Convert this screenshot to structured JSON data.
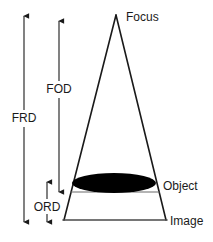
{
  "diagram": {
    "background_color": "#ffffff",
    "line_color": "#1a1a1a",
    "plane_line_color": "#555555",
    "object_fill_color": "#000000",
    "labels": {
      "focus": "Focus",
      "object": "Object",
      "image": "Image",
      "frd": "FRD",
      "fod": "FOD",
      "ord": "ORD"
    },
    "geometry": {
      "focus_point": {
        "x": 116,
        "y": 15
      },
      "cone_base_left": {
        "x": 64,
        "y": 220
      },
      "cone_base_right": {
        "x": 166,
        "y": 220
      },
      "object_plane_y": 192,
      "object_plane_left_x": 71,
      "object_plane_right_x": 159,
      "object_ellipse": {
        "cx": 114,
        "cy": 183,
        "rx": 42,
        "ry": 10
      }
    },
    "dimensions": [
      {
        "id": "frd",
        "label": "FRD",
        "x": 24,
        "top_y": 16,
        "bottom_y": 222,
        "label_y": 118
      },
      {
        "id": "fod",
        "label": "FOD",
        "x": 59,
        "top_y": 21,
        "bottom_y": 192,
        "label_y": 89
      },
      {
        "id": "ord",
        "label": "ORD",
        "x": 47,
        "top_y": 182,
        "bottom_y": 222,
        "label_y": 207
      }
    ]
  }
}
